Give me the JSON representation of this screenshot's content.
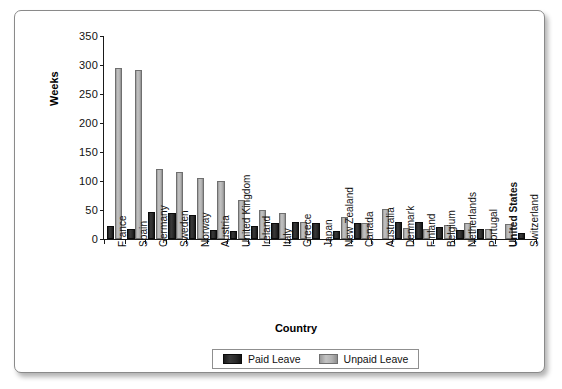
{
  "chart_data": {
    "type": "bar",
    "title": "",
    "xlabel": "Country",
    "ylabel": "Weeks",
    "ylim": [
      0,
      350
    ],
    "yticks": [
      0,
      50,
      100,
      150,
      200,
      250,
      300,
      350
    ],
    "grid": false,
    "legend_position": "bottom",
    "bold_categories": [
      "United States"
    ],
    "categories": [
      "France",
      "Spain",
      "Germany",
      "Sweden",
      "Norway",
      "Austria",
      "United Kingdom",
      "Ireland",
      "Italy",
      "Greece",
      "Japan",
      "New Zealand",
      "Canada",
      "Australia",
      "Denmark",
      "Finland",
      "Belgium",
      "Netherlands",
      "Portugal",
      "United States",
      "Switzerland"
    ],
    "series": [
      {
        "name": "Paid Leave",
        "color": "#2b2b2b",
        "values": [
          22,
          18,
          46,
          44,
          42,
          16,
          14,
          22,
          27,
          30,
          27,
          14,
          28,
          0,
          29,
          30,
          20,
          16,
          17,
          0,
          11
        ]
      },
      {
        "name": "Unpaid Leave",
        "color": "#b2b2b2",
        "values": [
          294,
          292,
          120,
          115,
          105,
          100,
          67,
          50,
          45,
          30,
          0,
          38,
          28,
          52,
          19,
          18,
          25,
          28,
          17,
          26,
          0
        ]
      }
    ]
  },
  "axes": {
    "y_title": "Weeks",
    "x_title": "Country",
    "y_tick_labels": [
      "0",
      "50",
      "100",
      "150",
      "200",
      "250",
      "300",
      "350"
    ]
  },
  "legend": {
    "entries": [
      {
        "label": "Paid Leave",
        "swatch": "paid-leave-swatch"
      },
      {
        "label": "Unpaid Leave",
        "swatch": "unpaid-leave-swatch"
      }
    ]
  }
}
